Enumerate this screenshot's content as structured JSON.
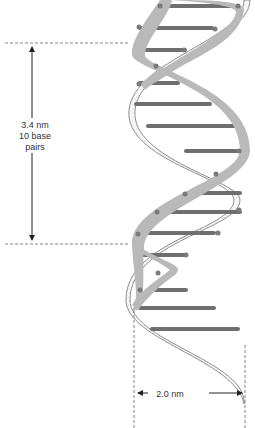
{
  "diagram": {
    "pitch_label": {
      "line1": "3.4 nm",
      "line2": "10 base pairs"
    },
    "width_label": "2.0 nm",
    "colors": {
      "backbone_front": "#b9b9b9",
      "backbone_back_outline": "#8c8c8c",
      "base_pair": "#6f6f6f",
      "backbone_dot": "#7a7a7a",
      "dimension_line": "#222222",
      "guide_dash": "#666666"
    }
  }
}
